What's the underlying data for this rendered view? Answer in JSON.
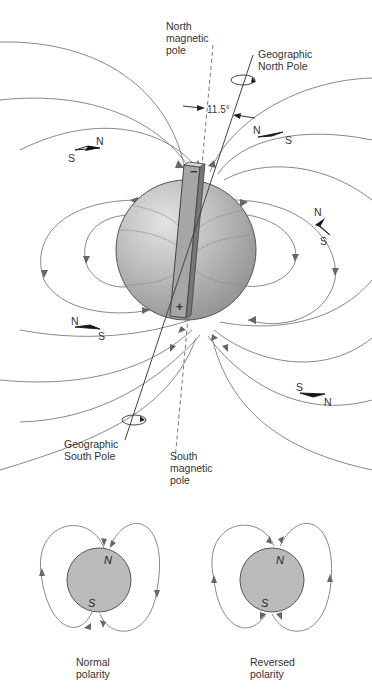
{
  "diagram": {
    "labels": {
      "north_magnetic_pole": "North\nmagnetic\npole",
      "geographic_north_pole": "Geographic\nNorth Pole",
      "angle": "11.5°",
      "geographic_south_pole": "Geographic\nSouth Pole",
      "south_magnetic_pole": "South\nmagnetic\npole",
      "magnet_top_sign": "−",
      "magnet_bottom_sign": "+"
    },
    "compasses": [
      {
        "n": "N",
        "s": "S"
      },
      {
        "n": "N",
        "s": "S"
      },
      {
        "n": "N",
        "s": "S"
      },
      {
        "n": "N",
        "s": "S"
      },
      {
        "n": "N",
        "s": "S"
      }
    ],
    "small_diagrams": [
      {
        "caption": "Normal\npolarity",
        "top": "N",
        "bottom": "S"
      },
      {
        "caption": "Reversed\npolarity",
        "top": "N",
        "bottom": "S"
      }
    ],
    "colors": {
      "earth": "#b8b8b8",
      "line": "#777777",
      "arrow": "#666666",
      "text": "#333333"
    }
  }
}
